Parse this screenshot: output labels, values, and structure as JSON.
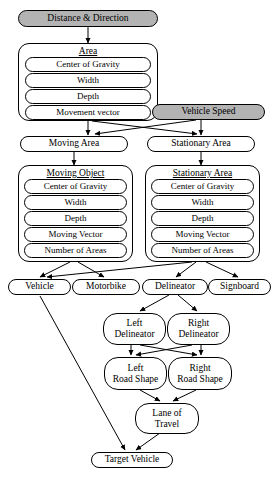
{
  "diagram": {
    "colors": {
      "stroke": "#000000",
      "background": "#ffffff",
      "shaded_fill": "#b3b3b3"
    },
    "nodes": {
      "distance_direction": {
        "label": "Distance & Direction",
        "style": "shaded-pill"
      },
      "vehicle_speed": {
        "label": "Vehicle Speed",
        "style": "shaded-pill"
      },
      "area": {
        "title": "Area",
        "items": [
          "Center of Gravity",
          "Width",
          "Depth",
          "Movement vector"
        ]
      },
      "moving_area": {
        "label": "Moving Area"
      },
      "stationary_area": {
        "label": "Stationary Area"
      },
      "moving_object": {
        "title": "Moving Object",
        "items": [
          "Center of Gravity",
          "Width",
          "Depth",
          "Moving Vector",
          "Number of Areas"
        ]
      },
      "stationary_area_detail": {
        "title": "Stationary Area",
        "items": [
          "Center of Gravity",
          "Width",
          "Depth",
          "Moving Vector",
          "Number of Areas"
        ]
      },
      "vehicle": {
        "label": "Vehicle"
      },
      "motorbike": {
        "label": "Motorbike"
      },
      "delineator": {
        "label": "Delineator"
      },
      "signboard": {
        "label": "Signboard"
      },
      "left_delineator": {
        "line1": "Left",
        "line2": "Delineator"
      },
      "right_delineator": {
        "line1": "Right",
        "line2": "Delineator"
      },
      "left_road_shape": {
        "line1": "Left",
        "line2": "Road Shape"
      },
      "right_road_shape": {
        "line1": "Right",
        "line2": "Road Shape"
      },
      "lane_of_travel": {
        "line1": "Lane of",
        "line2": "Travel"
      },
      "target_vehicle": {
        "label": "Target Vehicle"
      }
    }
  }
}
